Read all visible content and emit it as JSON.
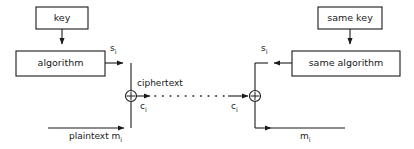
{
  "diagram": {
    "stroke_color": "#1a1a1a",
    "background_color": "#ffffff",
    "boxes": [
      {
        "id": "key",
        "label": "key",
        "x": 36,
        "y": 7,
        "w": 52,
        "h": 22
      },
      {
        "id": "algorithm",
        "label": "algorithm",
        "x": 16,
        "y": 51,
        "w": 89,
        "h": 25
      },
      {
        "id": "same-key",
        "label": "same key",
        "x": 318,
        "y": 7,
        "w": 64,
        "h": 22
      },
      {
        "id": "same-algorithm",
        "label": "same algorithm",
        "x": 292,
        "y": 51,
        "w": 108,
        "h": 25
      }
    ],
    "xor_nodes": [
      {
        "id": "encrypt-xor",
        "symbol": "+",
        "cx": 131,
        "cy": 96,
        "r": 5.5
      },
      {
        "id": "decrypt-xor",
        "symbol": "+",
        "cx": 255,
        "cy": 96,
        "r": 5.5
      }
    ],
    "labels": [
      {
        "id": "keystream-left",
        "text": "s",
        "subscript": "i",
        "x": 110,
        "y": 44
      },
      {
        "id": "keystream-right",
        "text": "s",
        "subscript": "i",
        "x": 261,
        "y": 44
      },
      {
        "id": "ciphertext",
        "text": "ciphertext",
        "subscript": "",
        "x": 137,
        "y": 79
      },
      {
        "id": "ciphertext-left",
        "text": "c",
        "subscript": "i",
        "x": 140,
        "y": 102
      },
      {
        "id": "ciphertext-right",
        "text": "c",
        "subscript": "i",
        "x": 231,
        "y": 102
      },
      {
        "id": "plaintext-in",
        "text": "plaintext m",
        "subscript": "i",
        "x": 69,
        "y": 132
      },
      {
        "id": "plaintext-out",
        "text": "m",
        "subscript": "i",
        "x": 300,
        "y": 132
      }
    ],
    "connections": [
      {
        "id": "key-to-algorithm",
        "style": "solid",
        "arrow": "down"
      },
      {
        "id": "algorithm-to-xor",
        "style": "solid",
        "arrow": "right"
      },
      {
        "id": "plaintext-to-xor",
        "style": "solid",
        "arrow": "right"
      },
      {
        "id": "ciphertext-channel",
        "style": "dotted",
        "arrow": "right"
      },
      {
        "id": "same-key-to-same-algorithm",
        "style": "solid",
        "arrow": "down"
      },
      {
        "id": "same-algorithm-to-xor",
        "style": "solid",
        "arrow": "left"
      },
      {
        "id": "xor-to-plaintext-out",
        "style": "solid",
        "arrow": "right"
      }
    ]
  }
}
